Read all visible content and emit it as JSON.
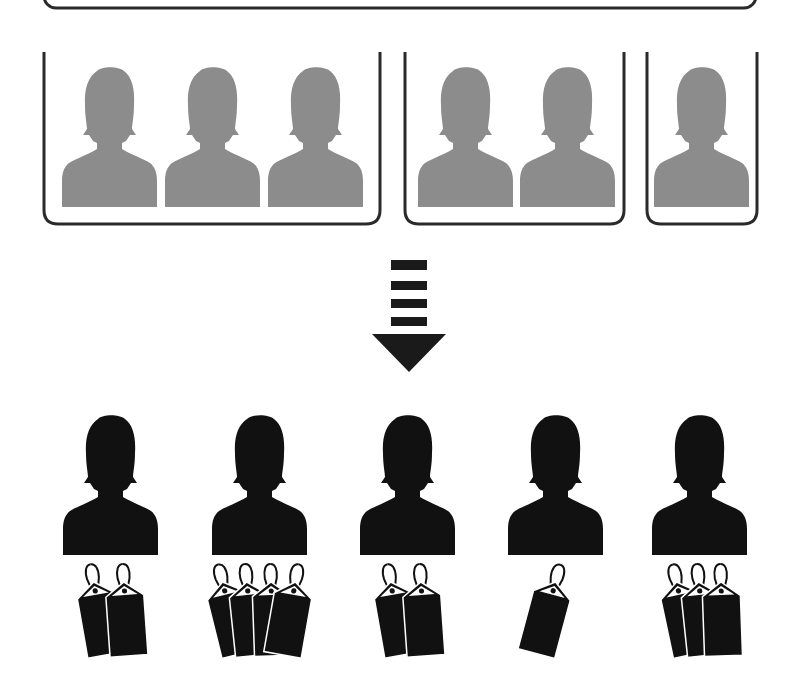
{
  "colors": {
    "background": "#ffffff",
    "frame_stroke": "#2a2a2a",
    "group_person": "#8c8c8c",
    "individual_person": "#111111",
    "arrow": "#1a1a1a",
    "tag": "#111111",
    "tag_label": "#ffffff"
  },
  "top_frame": {
    "x": 44,
    "y": -20,
    "width": 712,
    "height": 28
  },
  "groups": [
    {
      "id": "group-1",
      "x": 44,
      "y": 52,
      "width": 336,
      "height": 172,
      "members": [
        {
          "x": 62
        },
        {
          "x": 165
        },
        {
          "x": 268
        }
      ]
    },
    {
      "id": "group-2",
      "x": 405,
      "y": 52,
      "width": 219,
      "height": 172,
      "members": [
        {
          "x": 418
        },
        {
          "x": 520
        }
      ]
    },
    {
      "id": "group-3",
      "x": 647,
      "y": 52,
      "width": 110,
      "height": 172,
      "members": [
        {
          "x": 654
        }
      ]
    }
  ],
  "arrow": {
    "bars": [
      {
        "y": 260,
        "h": 10
      },
      {
        "y": 281,
        "h": 9
      },
      {
        "y": 299,
        "h": 9
      },
      {
        "y": 317,
        "h": 9
      }
    ],
    "bar_x": 391,
    "bar_w": 36,
    "head": {
      "left": 372,
      "right": 446,
      "top": 334,
      "tip_y": 372
    }
  },
  "individuals": [
    {
      "id": "person-1",
      "x": 63,
      "tags": 2
    },
    {
      "id": "person-2",
      "x": 212,
      "tags": 4
    },
    {
      "id": "person-3",
      "x": 360,
      "tags": 2
    },
    {
      "id": "person-4",
      "x": 508,
      "tags": 1
    },
    {
      "id": "person-5",
      "x": 652,
      "tags": 3
    }
  ]
}
